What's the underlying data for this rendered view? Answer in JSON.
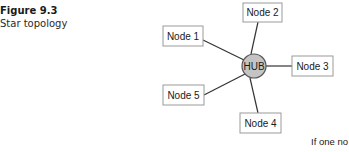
{
  "caption": {
    "label": "Figure 9.3",
    "title": "Star topology"
  },
  "diagram": {
    "hub": {
      "label": "HUB",
      "color": "#c4c4c4"
    },
    "nodes": [
      {
        "label": "Node 1"
      },
      {
        "label": "Node 2"
      },
      {
        "label": "Node 3"
      },
      {
        "label": "Node 4"
      },
      {
        "label": "Node 5"
      }
    ]
  },
  "body_text": "If one no"
}
